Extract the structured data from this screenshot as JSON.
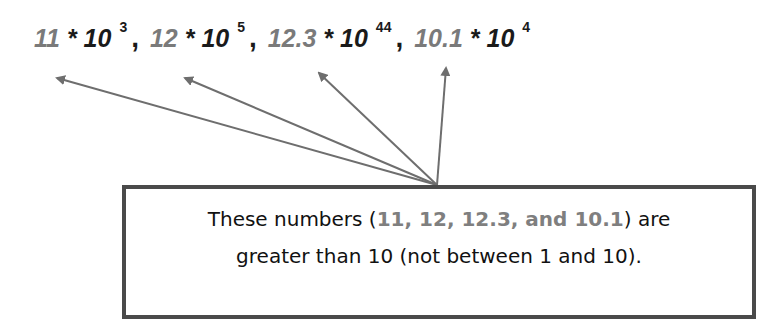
{
  "expression": {
    "terms": [
      {
        "coefficient": "11",
        "operator": "*",
        "base": "10",
        "exponent": "3"
      },
      {
        "coefficient": "12",
        "operator": "*",
        "base": "10",
        "exponent": "5"
      },
      {
        "coefficient": "12.3",
        "operator": "*",
        "base": "10",
        "exponent": "44"
      },
      {
        "coefficient": "10.1",
        "operator": "*",
        "base": "10",
        "exponent": "4"
      }
    ],
    "separator": ","
  },
  "arrows": [
    {
      "from": [
        437,
        185
      ],
      "to": [
        55,
        77
      ]
    },
    {
      "from": [
        437,
        185
      ],
      "to": [
        183,
        77
      ]
    },
    {
      "from": [
        437,
        185
      ],
      "to": [
        317,
        72
      ]
    },
    {
      "from": [
        437,
        185
      ],
      "to": [
        446,
        67
      ]
    }
  ],
  "callout": {
    "line1_prefix": "These numbers (",
    "line1_highlight": "11, 12, 12.3, and 10.1",
    "line1_suffix": ") are",
    "line2": "greater than 10 (not between 1 and 10)."
  },
  "colors": {
    "highlight": "#7f7f7f",
    "text": "#111111",
    "arrow": "#6e6e6e",
    "border": "#4a4a4a"
  }
}
